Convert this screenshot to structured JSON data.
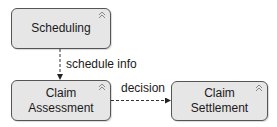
{
  "diagram": {
    "nodes": [
      {
        "id": "scheduling",
        "label": "Scheduling",
        "icon": "collapse-chevron-icon"
      },
      {
        "id": "assessment",
        "label": "Claim\nAssessment",
        "icon": "collapse-chevron-icon"
      },
      {
        "id": "settlement",
        "label": "Claim\nSettlement",
        "icon": "collapse-chevron-icon"
      }
    ],
    "edges": [
      {
        "from": "scheduling",
        "to": "assessment",
        "label": "schedule info",
        "style": "dashed"
      },
      {
        "from": "assessment",
        "to": "settlement",
        "label": "decision",
        "style": "dashed"
      }
    ],
    "colors": {
      "node_fill": "#e6e6e6",
      "node_border": "#555555",
      "edge": "#333333",
      "text": "#1a1a1a"
    }
  }
}
